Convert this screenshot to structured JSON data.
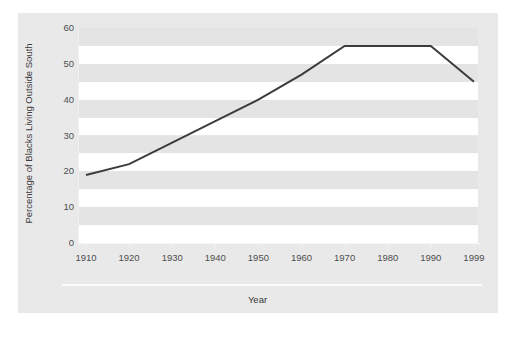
{
  "chart_data": {
    "type": "line",
    "title": "",
    "xlabel": "Year",
    "ylabel": "Percentage of Blacks Living Outside South",
    "x": [
      1910,
      1920,
      1930,
      1940,
      1950,
      1960,
      1970,
      1980,
      1990,
      1999
    ],
    "categories": [
      "1910",
      "1920",
      "1930",
      "1940",
      "1950",
      "1960",
      "1970",
      "1980",
      "1990",
      "1999"
    ],
    "values": [
      19,
      22,
      28,
      34,
      40,
      47,
      55,
      55,
      55,
      45
    ],
    "series": [
      {
        "name": "Percentage of Blacks Living Outside South",
        "values": [
          19,
          22,
          28,
          34,
          40,
          47,
          55,
          55,
          55,
          45
        ]
      }
    ],
    "xlim": [
      1910,
      1999
    ],
    "ylim": [
      0,
      60
    ],
    "yticks": [
      0,
      10,
      20,
      30,
      40,
      50,
      60
    ],
    "ytick_labels": [
      "0",
      "10",
      "20",
      "30",
      "40",
      "50",
      "60"
    ],
    "grid": false,
    "banded_background": true,
    "legend": false,
    "legend_position": "none",
    "line_color": "#3c3c3c",
    "band_color_light": "#ffffff",
    "band_color_dark": "#e4e4e4",
    "figure_background": "#e9e9e9"
  }
}
